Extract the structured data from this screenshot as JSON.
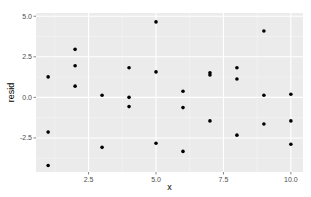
{
  "chart_data": {
    "type": "scatter",
    "title": "",
    "xlabel": "x",
    "ylabel": "resid",
    "xlim": [
      0.55,
      10.45
    ],
    "ylim": [
      -4.6,
      5.2
    ],
    "x_ticks": [
      2.5,
      5.0,
      7.5,
      10.0
    ],
    "x_tick_labels": [
      "2.5",
      "5.0",
      "7.5",
      "10.0"
    ],
    "y_ticks": [
      -2.5,
      0.0,
      2.5,
      5.0
    ],
    "y_tick_labels": [
      "-2.5",
      "0.0",
      "2.5",
      "5.0"
    ],
    "grid": true,
    "theme": "ggplot2 grey",
    "legend": null,
    "series": [
      {
        "name": "resid",
        "points": [
          {
            "x": 1,
            "y": 1.26
          },
          {
            "x": 1,
            "y": -2.14
          },
          {
            "x": 1,
            "y": -4.2
          },
          {
            "x": 2,
            "y": 2.96
          },
          {
            "x": 2,
            "y": 1.95
          },
          {
            "x": 2,
            "y": 0.69
          },
          {
            "x": 3,
            "y": 0.13
          },
          {
            "x": 3,
            "y": -3.08
          },
          {
            "x": 4,
            "y": 1.83
          },
          {
            "x": 4,
            "y": 0.0
          },
          {
            "x": 4,
            "y": -0.57
          },
          {
            "x": 5,
            "y": 4.65
          },
          {
            "x": 5,
            "y": 1.57
          },
          {
            "x": 5,
            "y": -2.83
          },
          {
            "x": 6,
            "y": 0.38
          },
          {
            "x": 6,
            "y": -0.63
          },
          {
            "x": 6,
            "y": -3.33
          },
          {
            "x": 7,
            "y": 1.51
          },
          {
            "x": 7,
            "y": 1.38
          },
          {
            "x": 7,
            "y": -1.45
          },
          {
            "x": 8,
            "y": 1.83
          },
          {
            "x": 8,
            "y": 1.13
          },
          {
            "x": 8,
            "y": -2.33
          },
          {
            "x": 9,
            "y": 4.09
          },
          {
            "x": 9,
            "y": 0.13
          },
          {
            "x": 9,
            "y": -1.64
          },
          {
            "x": 10,
            "y": 0.19
          },
          {
            "x": 10,
            "y": -1.45
          },
          {
            "x": 10,
            "y": -2.89
          }
        ]
      }
    ]
  },
  "colors": {
    "panel_background": "#ebebeb",
    "grid_major": "#ffffff",
    "grid_minor": "#f5f5f5",
    "point": "#000000",
    "tick_text": "#4d4d4d",
    "axis_title": "#000000"
  }
}
